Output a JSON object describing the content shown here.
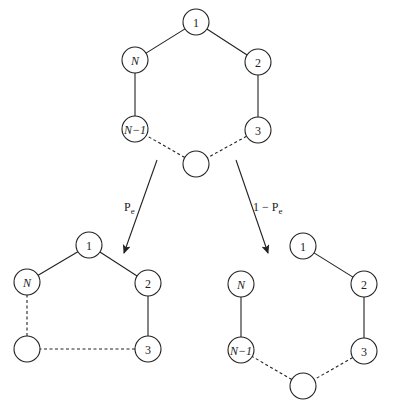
{
  "diagram": {
    "top_ring": {
      "nodes": [
        {
          "id": "t1",
          "label": "1",
          "italic": false,
          "x": 196,
          "y": 22
        },
        {
          "id": "t2",
          "label": "2",
          "italic": false,
          "x": 258,
          "y": 62
        },
        {
          "id": "t3",
          "label": "3",
          "italic": false,
          "x": 258,
          "y": 130
        },
        {
          "id": "tE",
          "label": "",
          "italic": false,
          "x": 196,
          "y": 164
        },
        {
          "id": "tNm1",
          "label": "N−1",
          "italic": true,
          "x": 135,
          "y": 129
        },
        {
          "id": "tN",
          "label": "N",
          "italic": true,
          "x": 135,
          "y": 60
        }
      ],
      "edges": [
        {
          "from": "tN",
          "to": "t1",
          "style": "solid"
        },
        {
          "from": "t1",
          "to": "t2",
          "style": "solid"
        },
        {
          "from": "t2",
          "to": "t3",
          "style": "solid"
        },
        {
          "from": "t3",
          "to": "tE",
          "style": "dashed"
        },
        {
          "from": "tE",
          "to": "tNm1",
          "style": "dashed"
        },
        {
          "from": "tNm1",
          "to": "tN",
          "style": "solid"
        }
      ]
    },
    "arrows": [
      {
        "id": "left",
        "label": "Pe",
        "label_main": "P",
        "label_sub": "e",
        "x1": 157,
        "y1": 160,
        "x2": 124,
        "y2": 253,
        "lx": 124,
        "ly": 211
      },
      {
        "id": "right",
        "label": "1 − Pe",
        "label_main": "1 − P",
        "label_sub": "e",
        "x1": 236,
        "y1": 160,
        "x2": 268,
        "y2": 253,
        "lx": 253,
        "ly": 211
      }
    ],
    "left_result": {
      "nodes": [
        {
          "id": "l1",
          "label": "1",
          "italic": false,
          "x": 89,
          "y": 245
        },
        {
          "id": "l2",
          "label": "2",
          "italic": false,
          "x": 148,
          "y": 283
        },
        {
          "id": "l3",
          "label": "3",
          "italic": false,
          "x": 148,
          "y": 349
        },
        {
          "id": "lE",
          "label": "",
          "italic": false,
          "x": 27,
          "y": 349
        },
        {
          "id": "lN",
          "label": "N",
          "italic": true,
          "x": 27,
          "y": 282
        }
      ],
      "edges": [
        {
          "from": "lN",
          "to": "l1",
          "style": "solid"
        },
        {
          "from": "l1",
          "to": "l2",
          "style": "solid"
        },
        {
          "from": "l2",
          "to": "l3",
          "style": "solid"
        },
        {
          "from": "l3",
          "to": "lE",
          "style": "dashed"
        },
        {
          "from": "lE",
          "to": "lN",
          "style": "dashed"
        }
      ]
    },
    "right_result": {
      "nodes": [
        {
          "id": "r1",
          "label": "1",
          "italic": false,
          "x": 303,
          "y": 246
        },
        {
          "id": "r2",
          "label": "2",
          "italic": false,
          "x": 364,
          "y": 284
        },
        {
          "id": "r3",
          "label": "3",
          "italic": false,
          "x": 364,
          "y": 351
        },
        {
          "id": "rE",
          "label": "",
          "italic": false,
          "x": 303,
          "y": 386
        },
        {
          "id": "rNm1",
          "label": "N−1",
          "italic": true,
          "x": 241,
          "y": 350
        },
        {
          "id": "rN",
          "label": "N",
          "italic": true,
          "x": 241,
          "y": 284
        }
      ],
      "edges": [
        {
          "from": "r1",
          "to": "r2",
          "style": "solid"
        },
        {
          "from": "r2",
          "to": "r3",
          "style": "solid"
        },
        {
          "from": "r3",
          "to": "rE",
          "style": "dashed"
        },
        {
          "from": "rE",
          "to": "rNm1",
          "style": "dashed"
        },
        {
          "from": "rNm1",
          "to": "rN",
          "style": "solid"
        }
      ]
    },
    "node_radius": 13
  }
}
